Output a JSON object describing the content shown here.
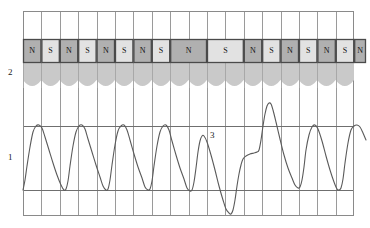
{
  "figure": {
    "background": "#ffffff"
  },
  "labels": [
    {
      "id": "label-1",
      "text": "1",
      "x": 8,
      "y": 153,
      "meaning": "signal-waveform-trace"
    },
    {
      "id": "label-2",
      "text": "2",
      "x": 8,
      "y": 68,
      "meaning": "magnetic-pole-track"
    },
    {
      "id": "label-3",
      "text": "3",
      "x": 210,
      "y": 131,
      "meaning": "index-anomaly-region"
    }
  ],
  "grid": {
    "x0": 23,
    "y0": 11,
    "x1": 354,
    "y1": 216,
    "columns": 18,
    "col_width": 18.4,
    "hlines": [
      44,
      63,
      126,
      190
    ],
    "border_color": "#8a8a8a",
    "line_color": "#9a9a9a",
    "bold_line_color": "#6f6f6f"
  },
  "poles": {
    "strip_top": 39,
    "strip_bottom": 63,
    "band_bottom": 86,
    "band_color": "#c9c9c9",
    "north_color": "#b0b0b0",
    "south_color": "#e2e2e2",
    "outline_color": "#4a4a4a",
    "scallop_count": 18,
    "items": [
      {
        "pole": "N",
        "start": 23,
        "end": 41.4
      },
      {
        "pole": "S",
        "start": 41.4,
        "end": 59.8
      },
      {
        "pole": "N",
        "start": 59.8,
        "end": 78.2
      },
      {
        "pole": "S",
        "start": 78.2,
        "end": 96.6
      },
      {
        "pole": "N",
        "start": 96.6,
        "end": 115.0
      },
      {
        "pole": "S",
        "start": 115.0,
        "end": 133.4
      },
      {
        "pole": "N",
        "start": 133.4,
        "end": 151.8
      },
      {
        "pole": "S",
        "start": 151.8,
        "end": 170.2
      },
      {
        "pole": "N",
        "start": 170.2,
        "end": 207.0
      },
      {
        "pole": "S",
        "start": 207.0,
        "end": 243.8
      },
      {
        "pole": "N",
        "start": 243.8,
        "end": 262.2
      },
      {
        "pole": "S",
        "start": 262.2,
        "end": 280.6
      },
      {
        "pole": "N",
        "start": 280.6,
        "end": 299.0
      },
      {
        "pole": "S",
        "start": 299.0,
        "end": 317.4
      },
      {
        "pole": "N",
        "start": 317.4,
        "end": 335.8
      },
      {
        "pole": "S",
        "start": 335.8,
        "end": 354.2
      },
      {
        "pole": "N",
        "start": 354.2,
        "end": 366.0
      }
    ]
  },
  "chart_data": {
    "type": "line",
    "xlabel": "",
    "ylabel": "",
    "xlim": [
      23,
      366
    ],
    "ylim": [
      216,
      100
    ],
    "grid": true,
    "legend": null,
    "series": [
      {
        "name": "signal",
        "color": "#5a5a5a",
        "line_width": 1.1,
        "description": "Sawtooth-like periodic trace: fast rise, slow fall; one disturbed cycle at marker 3 with deep undershoot and tall overshoot.",
        "points": [
          [
            23,
            190
          ],
          [
            25,
            180
          ],
          [
            27,
            166
          ],
          [
            30,
            147
          ],
          [
            33,
            132
          ],
          [
            36,
            126
          ],
          [
            39,
            125
          ],
          [
            42,
            128
          ],
          [
            45,
            137
          ],
          [
            49,
            150
          ],
          [
            53,
            163
          ],
          [
            57,
            175
          ],
          [
            61,
            185
          ],
          [
            64,
            190
          ],
          [
            66,
            189
          ],
          [
            68,
            181
          ],
          [
            70,
            166
          ],
          [
            73,
            146
          ],
          [
            76,
            132
          ],
          [
            79,
            126
          ],
          [
            82,
            125
          ],
          [
            85,
            129
          ],
          [
            88,
            139
          ],
          [
            92,
            152
          ],
          [
            96,
            165
          ],
          [
            100,
            177
          ],
          [
            103,
            186
          ],
          [
            106,
            190
          ],
          [
            108,
            189
          ],
          [
            110,
            180
          ],
          [
            112,
            165
          ],
          [
            115,
            145
          ],
          [
            118,
            131
          ],
          [
            121,
            126
          ],
          [
            124,
            125
          ],
          [
            127,
            130
          ],
          [
            130,
            140
          ],
          [
            134,
            154
          ],
          [
            138,
            167
          ],
          [
            142,
            178
          ],
          [
            145,
            187
          ],
          [
            148,
            190
          ],
          [
            150,
            189
          ],
          [
            152,
            181
          ],
          [
            154,
            166
          ],
          [
            157,
            146
          ],
          [
            160,
            132
          ],
          [
            163,
            126
          ],
          [
            166,
            125
          ],
          [
            169,
            130
          ],
          [
            172,
            141
          ],
          [
            176,
            155
          ],
          [
            180,
            168
          ],
          [
            184,
            179
          ],
          [
            187,
            188
          ],
          [
            190,
            191
          ],
          [
            192,
            190
          ],
          [
            194,
            182
          ],
          [
            196,
            168
          ],
          [
            198,
            152
          ],
          [
            200,
            141
          ],
          [
            202,
            136
          ],
          [
            204,
            136
          ],
          [
            207,
            142
          ],
          [
            211,
            155
          ],
          [
            215,
            170
          ],
          [
            219,
            186
          ],
          [
            223,
            200
          ],
          [
            226,
            209
          ],
          [
            229,
            213
          ],
          [
            231,
            214
          ],
          [
            233,
            210
          ],
          [
            235,
            200
          ],
          [
            237,
            186
          ],
          [
            239,
            174
          ],
          [
            241,
            165
          ],
          [
            243,
            159
          ],
          [
            246,
            156
          ],
          [
            250,
            154
          ],
          [
            254,
            153
          ],
          [
            257,
            152
          ],
          [
            259,
            150
          ],
          [
            261,
            140
          ],
          [
            263,
            126
          ],
          [
            265,
            114
          ],
          [
            267,
            106
          ],
          [
            269,
            103
          ],
          [
            271,
            104
          ],
          [
            273,
            110
          ],
          [
            276,
            122
          ],
          [
            280,
            139
          ],
          [
            284,
            155
          ],
          [
            288,
            168
          ],
          [
            292,
            178
          ],
          [
            295,
            185
          ],
          [
            298,
            188
          ],
          [
            300,
            187
          ],
          [
            302,
            180
          ],
          [
            304,
            167
          ],
          [
            306,
            150
          ],
          [
            309,
            135
          ],
          [
            312,
            127
          ],
          [
            315,
            125
          ],
          [
            318,
            129
          ],
          [
            322,
            141
          ],
          [
            326,
            156
          ],
          [
            330,
            170
          ],
          [
            334,
            182
          ],
          [
            337,
            189
          ],
          [
            339,
            190
          ],
          [
            341,
            188
          ],
          [
            343,
            179
          ],
          [
            345,
            163
          ],
          [
            348,
            143
          ],
          [
            351,
            130
          ],
          [
            354,
            126
          ],
          [
            357,
            125
          ],
          [
            360,
            127
          ],
          [
            363,
            133
          ],
          [
            366,
            140
          ]
        ]
      }
    ]
  }
}
